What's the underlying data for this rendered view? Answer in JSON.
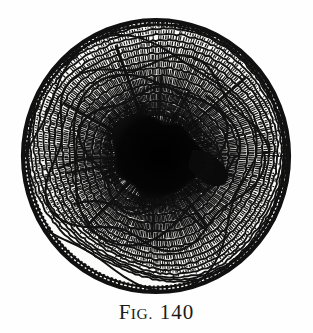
{
  "figure": {
    "caption_lead": "F",
    "caption_smallcaps": "IG.",
    "caption_number": "140",
    "caption_full": "FIG. 140"
  },
  "colors": {
    "background": "#fefefe",
    "ink": "#111111",
    "ink_soft": "#222222",
    "paper_tint": "#f7f7f4"
  },
  "geometry": {
    "center_x": 156,
    "center_y": 156,
    "outer_radius_x": 134,
    "outer_radius_y": 137,
    "pith_radius": 43,
    "ring_count": 14,
    "ray_count": 300
  },
  "chart_data": {
    "type": "scatter",
    "xlabel": "",
    "ylabel": "",
    "note": "Schematic cross-section: concentric growth rings at increasing radii from the pith.",
    "categories": [
      "pith",
      "ring 1",
      "ring 2",
      "ring 3",
      "ring 4",
      "ring 5",
      "ring 6",
      "ring 7",
      "ring 8",
      "ring 9",
      "ring 10",
      "ring 11",
      "ring 12",
      "ring 13",
      "bark"
    ],
    "values": [
      43,
      52,
      61,
      70,
      79,
      88,
      96,
      103,
      110,
      116,
      121,
      126,
      130,
      133,
      136
    ]
  }
}
